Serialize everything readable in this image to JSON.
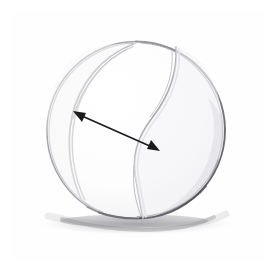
{
  "document": {
    "title": "Tennis ball pencil sketch",
    "medium": "graphite pencil on paper",
    "caption": "Hand-drawn tennis ball with a double-headed arrow indicating the diameter",
    "subject": "tennis-ball",
    "annotation_label": "",
    "background_color": "#ffffff",
    "paper_color": "#fefefe"
  },
  "frame": {
    "name": "image-border",
    "color": "#c9c9c9",
    "thickness_px": 1,
    "x": 10,
    "y": 10,
    "width": 255,
    "height": 252
  },
  "ball": {
    "name": "tennis-ball",
    "center_x": 136,
    "center_y": 130,
    "radius_x": 90,
    "radius_y": 89,
    "outline_color": "#8f8f92",
    "outline_dark_color": "#6d6d72",
    "fill_color": "#fdfdfd",
    "left_bound_x": 46,
    "right_bound_x": 226,
    "top_bound_y": 41,
    "bottom_bound_y": 219
  },
  "seams": {
    "name": "tennis-ball-seams",
    "color": "#b3b3b8",
    "highlight_color": "#d6d6da",
    "right_seam_label": "right-s-curve-seam",
    "left_seam_label": "left-crescent-seam",
    "description": "Two curved seam lines forming the characteristic tennis ball pattern"
  },
  "shadow": {
    "name": "cast-shadow",
    "color": "#b8b8bc",
    "center_x": 136,
    "center_y": 224,
    "width": 200,
    "height": 18
  },
  "arrow": {
    "name": "diameter-arrow",
    "type": "double-headed",
    "color": "#1a1a1a",
    "shaft_width_px": 1.6,
    "start_x": 74,
    "start_y": 112,
    "end_x": 158,
    "end_y": 150,
    "head_length_px": 11,
    "head_width_px": 8,
    "measurement_label": ""
  },
  "tones": {
    "highlight": "#ffffff",
    "light_gray": "#ededf0",
    "mid_gray": "#c4c4c8",
    "dark_gray": "#7a7a80",
    "graphite": "#55555b"
  }
}
